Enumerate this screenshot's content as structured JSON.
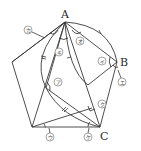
{
  "figure": {
    "points": {
      "A": {
        "label": "A",
        "x": 65,
        "y": 22
      },
      "B": {
        "label": "B",
        "x": 117,
        "y": 62
      },
      "C": {
        "label": "C",
        "x": 100,
        "y": 127
      }
    },
    "angle_labels": [
      {
        "id": "a",
        "text": "ア",
        "x": 58,
        "y": 82
      },
      {
        "id": "i",
        "text": "イ",
        "x": 102,
        "y": 61
      },
      {
        "id": "u",
        "text": "ウ",
        "x": 50,
        "y": 137
      },
      {
        "id": "e",
        "text": "エ",
        "x": 122,
        "y": 82
      },
      {
        "id": "o",
        "text": "オ",
        "x": 80,
        "y": 41
      },
      {
        "id": "ka",
        "text": "カ",
        "x": 28,
        "y": 30
      },
      {
        "id": "ki",
        "text": "キ",
        "x": 59,
        "y": 52
      },
      {
        "id": "ku",
        "text": "ク",
        "x": 102,
        "y": 104
      },
      {
        "id": "ke",
        "text": "ケ",
        "x": 88,
        "y": 137
      }
    ]
  }
}
